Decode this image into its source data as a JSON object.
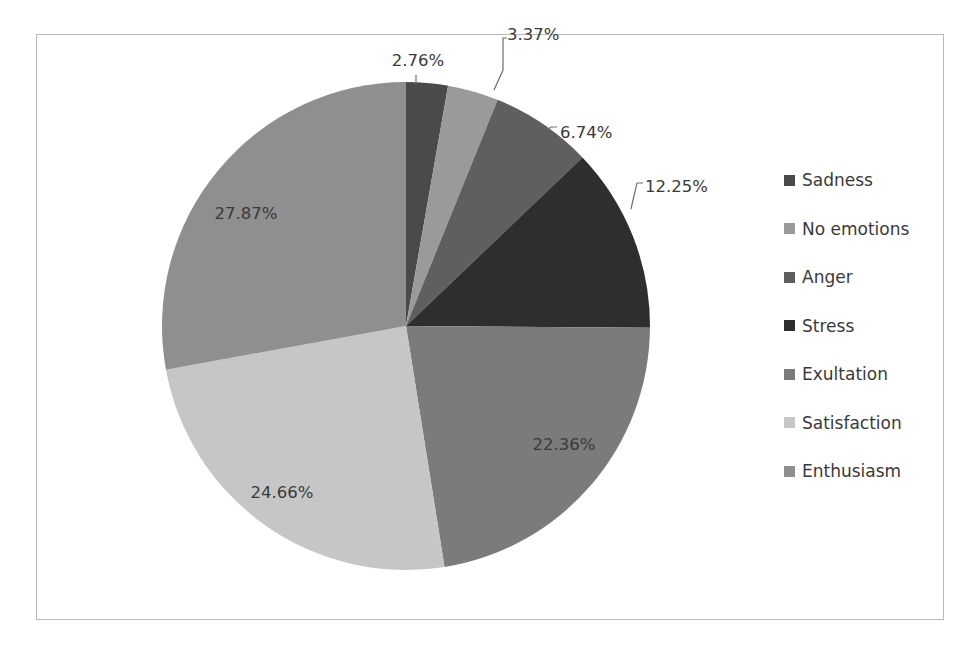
{
  "chart_data": {
    "type": "pie",
    "title": "",
    "start_angle_deg": 0,
    "direction": "clockwise",
    "categories": [
      "Sadness",
      "No emotions",
      "Anger",
      "Stress",
      "Exultation",
      "Satisfaction",
      "Enthusiasm"
    ],
    "values": [
      2.76,
      3.37,
      6.74,
      12.25,
      22.36,
      24.66,
      27.87
    ],
    "labels": [
      "2.76%",
      "3.37%",
      "6.74%",
      "12.25%",
      "22.36%",
      "24.66%",
      "27.87%"
    ],
    "colors": [
      "#4a4a4a",
      "#9a9a9a",
      "#5f5f5f",
      "#2e2e2e",
      "#7b7b7b",
      "#c6c6c6",
      "#8f8f8f"
    ],
    "legend_position": "right",
    "unit": "%"
  },
  "legend": {
    "items": [
      {
        "label": "Sadness",
        "color": "#4a4a4a"
      },
      {
        "label": "No emotions",
        "color": "#9a9a9a"
      },
      {
        "label": "Anger",
        "color": "#5f5f5f"
      },
      {
        "label": "Stress",
        "color": "#2e2e2e"
      },
      {
        "label": "Exultation",
        "color": "#7b7b7b"
      },
      {
        "label": "Satisfaction",
        "color": "#c6c6c6"
      },
      {
        "label": "Enthusiasm",
        "color": "#8f8f8f"
      }
    ]
  }
}
